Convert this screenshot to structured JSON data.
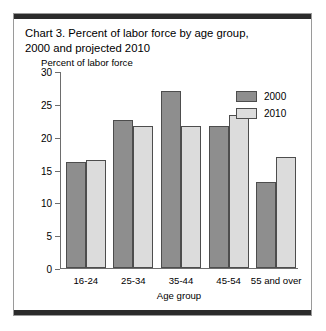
{
  "chart_data": {
    "type": "bar",
    "title": "Chart 3. Percent of labor force by age group, 2000 and projected 2010",
    "title_line1": "Chart 3. Percent of labor force by age group,",
    "title_line2": "2000 and projected 2010",
    "xlabel": "Age group",
    "ylabel": "Percent of labor force",
    "categories": [
      "16-24",
      "25-34",
      "35-44",
      "45-54",
      "55 and over"
    ],
    "series": [
      {
        "name": "2000",
        "color": "#8e8e8e",
        "values": [
          16.1,
          22.5,
          26.9,
          21.6,
          13.1
        ]
      },
      {
        "name": "2010",
        "color": "#dcdcdc",
        "values": [
          16.5,
          21.7,
          21.6,
          23.3,
          16.9
        ]
      }
    ],
    "ylim": [
      0,
      30
    ],
    "yticks": [
      0,
      5,
      10,
      15,
      20,
      25,
      30
    ],
    "ytick_labels": [
      "0",
      "5",
      "10",
      "15",
      "20",
      "25",
      "30"
    ],
    "grid": false,
    "legend_position": "top-right"
  }
}
